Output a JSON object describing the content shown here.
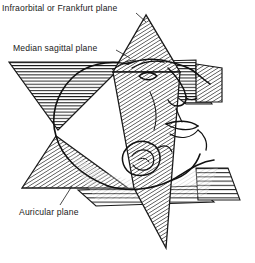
{
  "figure": {
    "background_color": "#ffffff",
    "ink_color": "#1a1a1a",
    "labels": {
      "frankfurt": "Infraorbital or Frankfurt plane",
      "sagittal": "Median sagittal plane",
      "auricular": "Auricular plane"
    },
    "planes": [
      {
        "id": "frankfurt",
        "name": "Infraorbital or Frankfurt plane",
        "hatch": "horizontal",
        "shape": "inverted-triangle-left-and-band-right",
        "label_position": "top-left"
      },
      {
        "id": "sagittal",
        "name": "Median sagittal plane",
        "hatch": "diagonal",
        "shape": "vertical-double-triangle",
        "label_position": "upper-left"
      },
      {
        "id": "auricular",
        "name": "Auricular plane",
        "hatch": "diagonal-and-horizontal",
        "shape": "triangle-left-and-band-right",
        "label_position": "lower-left"
      }
    ],
    "anatomy": [
      {
        "id": "head-profile",
        "name": "head profile outline"
      },
      {
        "id": "ear",
        "name": "auricle (ear)"
      },
      {
        "id": "eye",
        "name": "eye"
      },
      {
        "id": "nose",
        "name": "nose"
      },
      {
        "id": "mouth",
        "name": "mouth and lips"
      },
      {
        "id": "chin",
        "name": "chin"
      },
      {
        "id": "neck",
        "name": "neck"
      }
    ]
  }
}
